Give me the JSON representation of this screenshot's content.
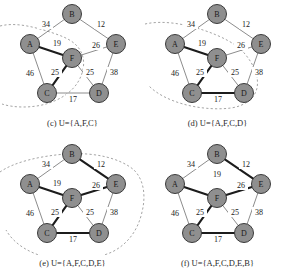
{
  "figure": {
    "node_fill": "#8f8f8f",
    "node_stroke": "#3a3a3a",
    "edge_color": "#6e6e6e",
    "tree_edge_color": "#1c1c1c",
    "hull_color": "#9a9a9a"
  },
  "graph": {
    "nodes": [
      {
        "id": "B",
        "label": "B",
        "x": 72,
        "y": 14
      },
      {
        "id": "A",
        "label": "A",
        "x": 30,
        "y": 44
      },
      {
        "id": "E",
        "label": "E",
        "x": 116,
        "y": 44
      },
      {
        "id": "F",
        "label": "F",
        "x": 72,
        "y": 58
      },
      {
        "id": "C",
        "label": "C",
        "x": 47,
        "y": 93
      },
      {
        "id": "D",
        "label": "D",
        "x": 99,
        "y": 93
      }
    ],
    "edges": [
      {
        "from": "A",
        "to": "B",
        "weight": 34,
        "lx": 46,
        "ly": 24
      },
      {
        "from": "B",
        "to": "E",
        "weight": 12,
        "lx": 101,
        "ly": 24
      },
      {
        "from": "A",
        "to": "F",
        "weight": 19,
        "lx": 57,
        "ly": 43
      },
      {
        "from": "F",
        "to": "E",
        "weight": 26,
        "lx": 96,
        "ly": 45
      },
      {
        "from": "A",
        "to": "C",
        "weight": 46,
        "lx": 30,
        "ly": 73
      },
      {
        "from": "F",
        "to": "C",
        "weight": 25,
        "lx": 55,
        "ly": 72
      },
      {
        "from": "F",
        "to": "D",
        "weight": 25,
        "lx": 90,
        "ly": 72
      },
      {
        "from": "E",
        "to": "D",
        "weight": 38,
        "lx": 114,
        "ly": 72
      },
      {
        "from": "C",
        "to": "D",
        "weight": 17,
        "lx": 73,
        "ly": 99
      }
    ]
  },
  "panels": [
    {
      "key": "c",
      "caption": "(c) U={A,F,C}",
      "tree_edges": [
        "A-F",
        "F-C"
      ],
      "set_members": [
        "A",
        "F",
        "C"
      ],
      "bf_label_19": false
    },
    {
      "key": "d",
      "caption": "(d) U={A,F,C,D}",
      "tree_edges": [
        "A-F",
        "F-C",
        "C-D"
      ],
      "set_members": [
        "A",
        "F",
        "C",
        "D"
      ],
      "bf_label_19": false
    },
    {
      "key": "e",
      "caption": "(e) U={A,F,C,D,E}",
      "tree_edges": [
        "A-F",
        "F-C",
        "C-D",
        "F-E",
        "B-E"
      ],
      "set_members": [
        "A",
        "F",
        "C",
        "D",
        "E"
      ],
      "bf_label_19": false
    },
    {
      "key": "f",
      "caption": "(f) U={A,F,C,D,E,B}",
      "tree_edges": [
        "A-F",
        "F-C",
        "C-D",
        "F-E",
        "B-E"
      ],
      "set_members": [],
      "bf_label_19": true
    }
  ]
}
